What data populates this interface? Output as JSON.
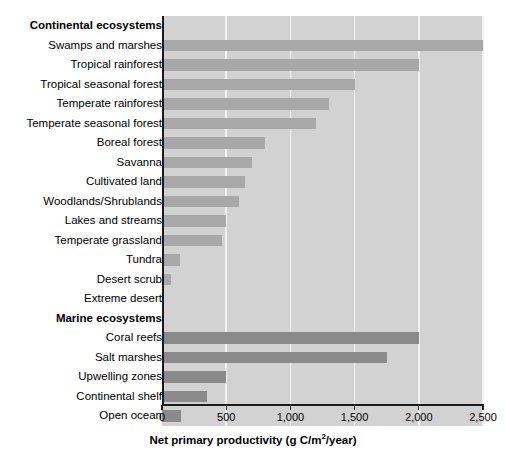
{
  "chart_data": {
    "type": "bar",
    "orientation": "horizontal",
    "title": "",
    "xlabel": "Net primary productivity (g C/m2/year)",
    "xlabel_parts": {
      "pre": "Net primary productivity (g C/m",
      "sup": "2",
      "post": "/year)"
    },
    "ylabel": "",
    "xlim": [
      0,
      2500
    ],
    "xticks": [
      0,
      500,
      1000,
      1500,
      2000,
      2500
    ],
    "xticklabels": [
      "0",
      "500",
      "1,000",
      "1,500",
      "2,000",
      "2,500"
    ],
    "grid": true,
    "grid_axis": "x",
    "legend": "none",
    "groups": [
      {
        "name": "Continental ecosystems",
        "color": "#a8a8a8",
        "categories": [
          "Swamps and marshes",
          "Tropical rainforest",
          "Tropical seasonal forest",
          "Temperate rainforest",
          "Temperate seasonal forest",
          "Boreal forest",
          "Savanna",
          "Cultivated land",
          "Woodlands/Shrublands",
          "Lakes and streams",
          "Temperate grassland",
          "Tundra",
          "Desert scrub",
          "Extreme desert"
        ],
        "values": [
          2500,
          2000,
          1500,
          1300,
          1200,
          800,
          700,
          650,
          600,
          500,
          470,
          140,
          70,
          3
        ]
      },
      {
        "name": "Marine ecosystems",
        "color": "#8a8a8a",
        "categories": [
          "Coral reefs",
          "Salt marshes",
          "Upwelling zones",
          "Continental shelf",
          "Open ocean"
        ],
        "values": [
          2000,
          1750,
          500,
          350,
          150
        ]
      }
    ]
  },
  "colors": {
    "plot_background": "#d2d2d2",
    "gridline": "#f2f2f2",
    "continental_bar": "#a8a8a8",
    "marine_bar": "#8a8a8a",
    "axis": "#1a1a1a",
    "text": "#000000"
  }
}
